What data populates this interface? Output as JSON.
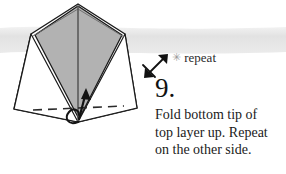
{
  "page": {
    "width": 286,
    "height": 174,
    "background_color": "#ffffff",
    "band_color": "#e4e4e4"
  },
  "step": {
    "number_label": "9.",
    "instruction_lines": [
      "Fold bottom tip of",
      "top layer up. Repeat",
      "on the other side."
    ],
    "instruction_full": "Fold bottom tip of top layer up. Repeat on the other side."
  },
  "repeat_marker": {
    "star_glyph": "✳",
    "label": "repeat",
    "arrow_name": "repeat-double-arrow",
    "cross_name": "repeat-cross-mark"
  },
  "diagram": {
    "name": "origami-step-diagram",
    "fill_color": "#b2b2b2",
    "stroke_color": "#1a1a1a",
    "crease_color": "#3a3a3a",
    "outer_polygon": "78,4 125,34 137,108 78,122 14,109 31,34",
    "shaded_polygon": "78,6 122,35 79,119 35,35",
    "left_white_polygon": "31,34 78,122 14,109",
    "right_white_polygon": "125,34 137,108 78,122",
    "center_crease": "78,6 78,121",
    "dashed_fold_line": "32,110 124,106",
    "fold_arrow_name": "fold-up-arrow",
    "loop_arrow_name": "fold-loop-arrow"
  }
}
